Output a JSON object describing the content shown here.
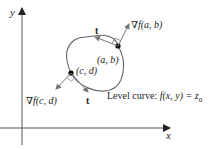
{
  "axes": {
    "x_label": "x",
    "y_label": "y",
    "color": "#333333"
  },
  "curve": {
    "label_prefix": "Level curve: ",
    "label_expr": "f(x, y) = z",
    "label_sub": "0",
    "color": "#555555"
  },
  "points": {
    "ab": {
      "label": "(a, b)",
      "gradient_label": "∇f(a, b)",
      "tangent_label": "t"
    },
    "cd": {
      "label": "(c, d)",
      "gradient_label": "∇f(c, d)",
      "tangent_label": "t"
    }
  },
  "colors": {
    "arrow": "#777777",
    "point": "#000000"
  }
}
